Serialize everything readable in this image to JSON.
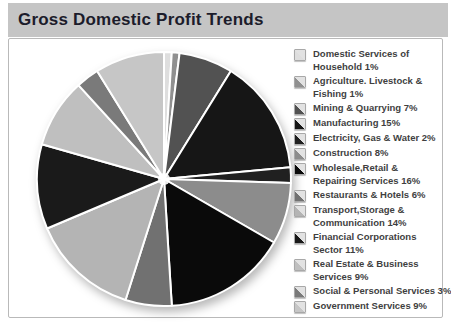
{
  "window": {
    "title": "Gross Domestic Profit Trends"
  },
  "colors": {
    "title_bar_bg": "#c5c5c5",
    "title_text": "#1c1c2b",
    "content_bg": "#ffffff",
    "content_border": "#b9b9b9",
    "legend_text": "#3f3f3f",
    "separator": "#ffffff",
    "swatch_light": "#e2e2e2"
  },
  "chart_data": {
    "type": "pie",
    "title": "Gross Domestic Profit Trends",
    "value_unit": "%",
    "start_angle_deg": 0,
    "direction": "clockwise",
    "legend_position": "right",
    "slices": [
      {
        "label": "Domestic Services of Household",
        "value": 1,
        "color": "#dedede",
        "legend_lines": [
          "Domestic Services of",
          "Household 1%"
        ]
      },
      {
        "label": "Agriculture. Livestock & Fishing",
        "value": 1,
        "color": "#909090",
        "legend_lines": [
          "Agriculture. Livestock &",
          "Fishing 1%"
        ]
      },
      {
        "label": "Mining & Quarrying",
        "value": 7,
        "color": "#525252",
        "legend_lines": [
          "Mining & Quarrying 7%"
        ]
      },
      {
        "label": "Manufacturing",
        "value": 15,
        "color": "#161616",
        "legend_lines": [
          "Manufacturing 15%"
        ]
      },
      {
        "label": "Electricity, Gas & Water",
        "value": 2,
        "color": "#202020",
        "legend_lines": [
          "Electricity, Gas & Water 2%"
        ]
      },
      {
        "label": "Construction",
        "value": 8,
        "color": "#8c8c8c",
        "legend_lines": [
          "Construction 8%"
        ]
      },
      {
        "label": "Wholesale,Retail & Repairing Services",
        "value": 16,
        "color": "#0a0a0a",
        "legend_lines": [
          "Wholesale,Retail &",
          "Repairing Services 16%"
        ]
      },
      {
        "label": "Restaurants & Hotels",
        "value": 6,
        "color": "#717171",
        "legend_lines": [
          "Restaurants & Hotels 6%"
        ]
      },
      {
        "label": "Transport,Storage & Communication",
        "value": 14,
        "color": "#b4b4b4",
        "legend_lines": [
          "Transport,Storage &",
          "Communication 14%"
        ]
      },
      {
        "label": "Financial Corporations Sector",
        "value": 11,
        "color": "#1a1a1a",
        "legend_lines": [
          "Financial Corporations",
          "Sector 11%"
        ]
      },
      {
        "label": "Real Estate & Business Services",
        "value": 9,
        "color": "#bfbfbf",
        "legend_lines": [
          "Real Estate & Business",
          "Services 9%"
        ]
      },
      {
        "label": "Social & Personal Services",
        "value": 3,
        "color": "#7a7a7a",
        "legend_lines": [
          "Social & Personal Services 3%"
        ]
      },
      {
        "label": "Government Services",
        "value": 9,
        "color": "#c6c6c6",
        "legend_lines": [
          "Government Services 9%"
        ]
      }
    ]
  }
}
